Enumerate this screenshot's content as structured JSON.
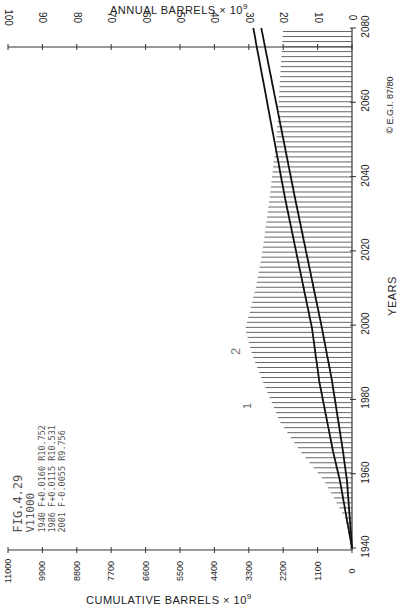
{
  "chart_data": {
    "type": "area",
    "orientation": "rotated 90 degrees (years axis vertical on right, values horizontal)",
    "title": "FIG.4.29",
    "annotations": {
      "figure_label": "FIG.4.29",
      "ultimate": "V11000",
      "params": [
        "1940 F+0.0160 R10.752",
        "1986 F+0.0115 R10.531",
        "2001 F-0.0055 R9.756"
      ],
      "curve_labels": [
        "1",
        "2"
      ],
      "copyright": "© E.G.I. 87/80"
    },
    "xlabel": "YEARS",
    "ylabel_top": "ANNUAL BARRELS × 10⁹",
    "ylabel_bottom": "CUMULATIVE BARRELS × 10⁹",
    "x_ticks": [
      1940,
      1960,
      1980,
      2000,
      2020,
      2040,
      2060,
      2080
    ],
    "annual_ticks": [
      100,
      90,
      80,
      70,
      60,
      50,
      40,
      30,
      20,
      10,
      0
    ],
    "cumulative_ticks": [
      11000,
      9900,
      8800,
      7700,
      6600,
      5500,
      4400,
      3300,
      2200,
      1100,
      0
    ],
    "annual_range": [
      0,
      100
    ],
    "cumulative_range": [
      0,
      11000
    ],
    "x_range": [
      1940,
      2080
    ],
    "series": [
      {
        "name": "Annual production (hatched area)",
        "axis": "annual",
        "x": [
          1940,
          1948,
          1958,
          1966,
          1974,
          1985,
          1992,
          1999,
          2010,
          2020,
          2034,
          2050,
          2065,
          2080
        ],
        "values": [
          0,
          2,
          8,
          15,
          21,
          26,
          29,
          31,
          28,
          26,
          24,
          22,
          21,
          20
        ]
      },
      {
        "name": "Cumulative curve 1",
        "axis": "cumulative",
        "x": [
          1940,
          1958,
          1966,
          1985,
          1999,
          2034,
          2080
        ],
        "values": [
          0,
          383,
          606,
          1050,
          1275,
          2136,
          3157
        ]
      },
      {
        "name": "Cumulative curve 2",
        "axis": "cumulative",
        "x": [
          1940,
          1958,
          1966,
          1985,
          1999,
          2034,
          2080
        ],
        "values": [
          0,
          160,
          287,
          640,
          956,
          1817,
          2901
        ]
      }
    ],
    "grid": false,
    "legend": "none (curves labeled 1 and 2 inline)"
  },
  "labels": {
    "top_axis_title": "ANNUAL  BARRELS × 10",
    "top_axis_exp": "9",
    "bottom_axis_title": "CUMULATIVE  BARRELS × 10",
    "bottom_axis_exp": "9",
    "years_title": "YEARS",
    "fig": "FIG.4.29",
    "ultimate": "V11000",
    "p1": "1940 F+0.0160 R10.752",
    "p2": "1986 F+0.0115 R10.531",
    "p3": "2001 F-0.0055 R9.756",
    "curve1": "1",
    "curve2": "2",
    "copyright": "© E.G.I. 87/80"
  }
}
